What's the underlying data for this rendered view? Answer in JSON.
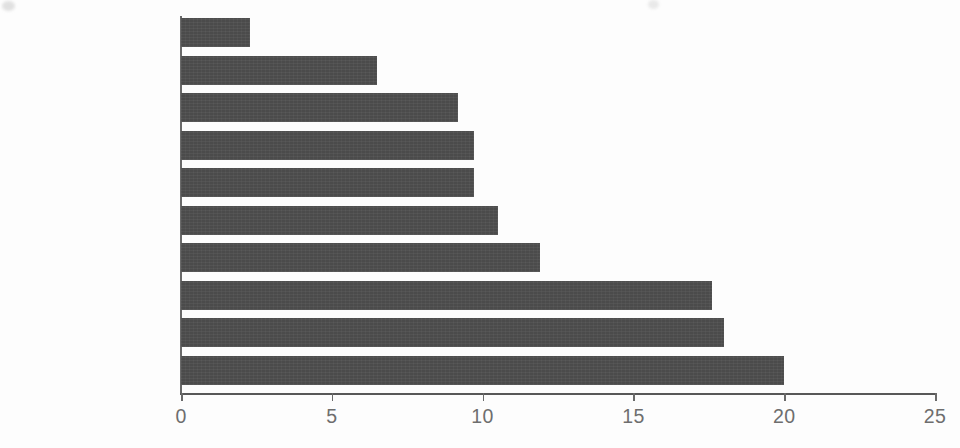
{
  "chart_data": {
    "type": "bar",
    "orientation": "horizontal",
    "title": "",
    "subtitle": "",
    "xlabel": "",
    "ylabel": "",
    "categories": [
      "Swede",
      "Pumpkin",
      "Celeriac",
      "Carrot",
      "Beetroot",
      "Butternut squash",
      "Turnip",
      "Potato",
      "Parsnip",
      "Sweet potato"
    ],
    "values": [
      2.3,
      6.5,
      9.2,
      9.7,
      9.7,
      10.5,
      11.9,
      17.6,
      18.0,
      20.0
    ],
    "xlim": [
      0,
      25
    ],
    "xticks": [
      0,
      5,
      10,
      15,
      20,
      25
    ],
    "xtick_labels": [
      "0",
      "5",
      "10",
      "15",
      "20",
      "25"
    ],
    "grid": false,
    "legend": null,
    "legend_position": "none",
    "annotations": [],
    "bar_color": "#4b4b4b",
    "label_color": "#6e6e6e",
    "axis_color": "#6a6a6a",
    "background_color": "#fdfdfd"
  }
}
